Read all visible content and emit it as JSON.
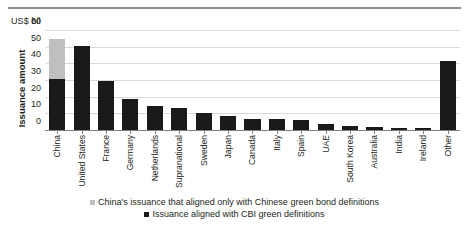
{
  "chart_data": {
    "type": "bar",
    "title": "",
    "subtitle": "",
    "unit_label": "US$ bil",
    "xlabel": "",
    "ylabel": "Issuance amount",
    "ylim": [
      0,
      60
    ],
    "yticks": [
      60,
      50,
      40,
      30,
      20,
      10,
      0
    ],
    "grid": true,
    "stacked": true,
    "legend_position": "bottom",
    "categories": [
      "China",
      "United States",
      "France",
      "Germany",
      "Netherlands",
      "Supranational",
      "Sweden",
      "Japan",
      "Canada",
      "Italy",
      "Spain",
      "UAE",
      "South Korea",
      "Australia",
      "India",
      "Ireland",
      "Other"
    ],
    "series": [
      {
        "name": "Issuance aligned with CBI green definitions",
        "color": "#1a1a1a",
        "values": [
          31,
          51,
          30,
          19,
          15,
          14,
          11,
          9,
          7,
          7,
          6.5,
          4,
          3,
          2.5,
          2,
          2,
          42
        ]
      },
      {
        "name": "China's issuance that aligned only with Chinese green bond definitions",
        "color": "#bfbfbf",
        "values": [
          24.5,
          0,
          0,
          0,
          0,
          0,
          0,
          0,
          0,
          0,
          0,
          0,
          0,
          0,
          0,
          0,
          0
        ]
      }
    ],
    "totals": [
      55.5,
      51,
      30,
      19,
      15,
      14,
      11,
      9,
      7,
      7,
      6.5,
      4,
      3,
      2.5,
      2,
      2,
      42
    ]
  },
  "legend": {
    "entries": [
      {
        "label": "China's issuance that aligned only with Chinese green bond definitions",
        "color": "#bfbfbf"
      },
      {
        "label": "Issuance aligned with CBI green definitions",
        "color": "#1a1a1a"
      }
    ]
  }
}
